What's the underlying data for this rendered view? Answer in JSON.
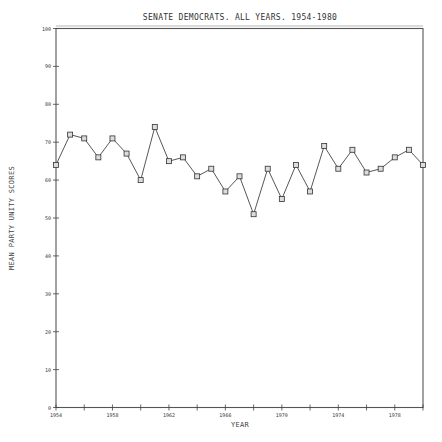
{
  "chart_data": {
    "type": "line",
    "title": "SENATE DEMOCRATS. ALL YEARS. 1954-1980",
    "xlabel": "YEAR",
    "ylabel": "MEAN PARTY UNITY SCORES",
    "xlim": [
      1954,
      1980
    ],
    "ylim": [
      0,
      100
    ],
    "x_ticks": [
      1954,
      1956,
      1958,
      1960,
      1962,
      1964,
      1966,
      1968,
      1970,
      1972,
      1974,
      1976,
      1978,
      1980
    ],
    "x_tick_labels": [
      "1954",
      "",
      "1958",
      "",
      "1962",
      "",
      "1966",
      "",
      "1970",
      "",
      "1974",
      "",
      "1978",
      ""
    ],
    "y_ticks": [
      0,
      10,
      20,
      30,
      40,
      50,
      60,
      70,
      80,
      90,
      100
    ],
    "y_tick_labels": [
      "0",
      "10",
      "20",
      "30",
      "40",
      "50",
      "60",
      "70",
      "80",
      "90",
      "100"
    ],
    "grid": false,
    "legend": null,
    "marker": "square",
    "x": [
      1954,
      1955,
      1956,
      1957,
      1958,
      1959,
      1960,
      1961,
      1962,
      1963,
      1964,
      1965,
      1966,
      1967,
      1968,
      1969,
      1970,
      1971,
      1972,
      1973,
      1974,
      1975,
      1976,
      1977,
      1978,
      1979,
      1980
    ],
    "series": [
      {
        "name": "Senate Democrats",
        "values": [
          64,
          72,
          71,
          66,
          71,
          67,
          60,
          74,
          65,
          66,
          61,
          63,
          57,
          61,
          51,
          63,
          55,
          64,
          57,
          69,
          63,
          68,
          62,
          63,
          66,
          68,
          64
        ]
      }
    ]
  }
}
